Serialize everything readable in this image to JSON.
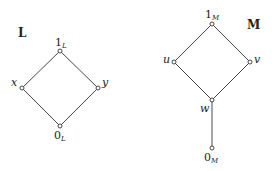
{
  "diagrams": [
    {
      "name": "L",
      "title": "L",
      "nodes": [
        {
          "id": "1L",
          "main": "1",
          "sub": "L"
        },
        {
          "id": "x",
          "main": "x",
          "sub": ""
        },
        {
          "id": "y",
          "main": "y",
          "sub": ""
        },
        {
          "id": "0L",
          "main": "0",
          "sub": "L"
        }
      ],
      "edges": [
        [
          "1L",
          "x"
        ],
        [
          "1L",
          "y"
        ],
        [
          "x",
          "0L"
        ],
        [
          "y",
          "0L"
        ]
      ]
    },
    {
      "name": "M",
      "title": "M",
      "nodes": [
        {
          "id": "1M",
          "main": "1",
          "sub": "M"
        },
        {
          "id": "u",
          "main": "u",
          "sub": ""
        },
        {
          "id": "v",
          "main": "v",
          "sub": ""
        },
        {
          "id": "w",
          "main": "w",
          "sub": ""
        },
        {
          "id": "0M",
          "main": "0",
          "sub": "M"
        }
      ],
      "edges": [
        [
          "1M",
          "u"
        ],
        [
          "1M",
          "v"
        ],
        [
          "u",
          "w"
        ],
        [
          "v",
          "w"
        ],
        [
          "w",
          "0M"
        ]
      ]
    }
  ]
}
